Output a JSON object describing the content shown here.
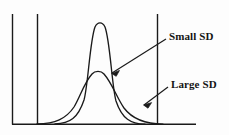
{
  "figure": {
    "title": "",
    "background_color": "#fdfdfd",
    "ink_color": "#1a1a1a",
    "annotations": {
      "small_sd_label": "Small SD",
      "large_sd_label": "Large SD"
    }
  },
  "chart_data": {
    "type": "line",
    "title": "",
    "xlabel": "",
    "ylabel": "",
    "grid": false,
    "legend": "none",
    "axis": {
      "y_axis_x": 12,
      "y_axis_top": 14,
      "baseline_y": 124,
      "baseline_x_start": 12,
      "baseline_x_end": 196
    },
    "reference_lines": [
      {
        "name": "left-reference-line",
        "x": 37,
        "y_top": 14,
        "y_bottom": 124
      },
      {
        "name": "right-reference-line",
        "x": 157,
        "y_top": 14,
        "y_bottom": 124
      }
    ],
    "series": [
      {
        "name": "Small SD",
        "description": "narrow tall normal curve",
        "mean": 100,
        "peak_height": 102,
        "relative_sd": 1,
        "annotation": "Small SD",
        "arrow_from": [
          166,
          39
        ],
        "arrow_to": [
          112,
          73
        ]
      },
      {
        "name": "Large SD",
        "description": "wide flat normal curve",
        "mean": 98,
        "peak_height": 55,
        "relative_sd": 2.6,
        "annotation": "Large SD",
        "arrow_from": [
          168,
          87
        ],
        "arrow_to": [
          144,
          105
        ]
      }
    ]
  }
}
